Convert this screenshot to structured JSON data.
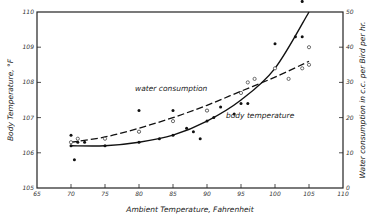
{
  "chart_data": {
    "type": "scatter",
    "title": "",
    "xlabel": "Ambient Temperature, Fahrenheit",
    "ylabel": "Body Temperature, °F",
    "ylabel_right": "Water consumption in c.c. per Bird per hr.",
    "xlim": [
      65,
      110
    ],
    "ylim": [
      105,
      110
    ],
    "ylim_right": [
      0,
      50
    ],
    "x_ticks": [
      65,
      70,
      75,
      80,
      85,
      90,
      95,
      100,
      105,
      110
    ],
    "y_ticks": [
      105,
      106,
      107,
      108,
      109,
      110
    ],
    "y_ticks_right": [
      0,
      10,
      20,
      30,
      40,
      50
    ],
    "grid": false,
    "series": [
      {
        "name": "body temperature",
        "style": "solid curve, filled dots",
        "points": [
          [
            70,
            106.5
          ],
          [
            70,
            106.2
          ],
          [
            70.5,
            105.8
          ],
          [
            71,
            106.3
          ],
          [
            72,
            106.3
          ],
          [
            75,
            106.2
          ],
          [
            80,
            106.3
          ],
          [
            80,
            106.6
          ],
          [
            80,
            107.2
          ],
          [
            83,
            106.4
          ],
          [
            85,
            106.5
          ],
          [
            85,
            107.2
          ],
          [
            87,
            106.7
          ],
          [
            88,
            106.6
          ],
          [
            89,
            106.4
          ],
          [
            90,
            106.9
          ],
          [
            90,
            107.2
          ],
          [
            91,
            107.0
          ],
          [
            92,
            107.3
          ],
          [
            94,
            107.1
          ],
          [
            95,
            107.4
          ],
          [
            96,
            107.4
          ],
          [
            100,
            109.1
          ],
          [
            103,
            109.3
          ],
          [
            104,
            109.3
          ],
          [
            104,
            110.3
          ]
        ],
        "fit_curve": [
          [
            70,
            106.2
          ],
          [
            75,
            106.2
          ],
          [
            80,
            106.3
          ],
          [
            85,
            106.5
          ],
          [
            90,
            106.9
          ],
          [
            95,
            107.5
          ],
          [
            100,
            108.4
          ],
          [
            105,
            110.0
          ]
        ]
      },
      {
        "name": "water consumption",
        "style": "dashed curve, open circles",
        "points": [
          [
            70,
            13
          ],
          [
            71,
            14
          ],
          [
            75,
            14
          ],
          [
            80,
            16
          ],
          [
            85,
            19
          ],
          [
            90,
            22
          ],
          [
            95,
            27
          ],
          [
            96,
            30
          ],
          [
            97,
            31
          ],
          [
            100,
            34
          ],
          [
            102,
            31
          ],
          [
            104,
            34
          ],
          [
            105,
            35
          ],
          [
            105,
            40
          ]
        ],
        "fit_curve": [
          [
            70,
            13
          ],
          [
            75,
            14.5
          ],
          [
            80,
            17
          ],
          [
            85,
            20
          ],
          [
            90,
            23.5
          ],
          [
            95,
            27.5
          ],
          [
            100,
            31.5
          ],
          [
            105,
            36
          ]
        ]
      }
    ],
    "annotations": [
      "water consumption",
      "body temperature"
    ]
  }
}
